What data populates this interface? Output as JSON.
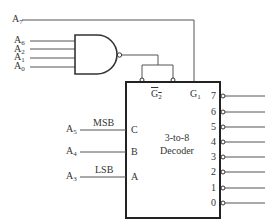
{
  "diagram": {
    "type": "logic-circuit"
  },
  "inputs": {
    "a7": {
      "base": "A",
      "sub": "7"
    },
    "a6": {
      "base": "A",
      "sub": "6"
    },
    "a2": {
      "base": "A",
      "sub": "2"
    },
    "a1": {
      "base": "A",
      "sub": "1"
    },
    "a0": {
      "base": "A",
      "sub": "0"
    },
    "a5": {
      "base": "A",
      "sub": "5"
    },
    "a4": {
      "base": "A",
      "sub": "4"
    },
    "a3": {
      "base": "A",
      "sub": "3"
    }
  },
  "annotations": {
    "msb": "MSB",
    "lsb": "LSB"
  },
  "gate": {
    "type": "NAND",
    "inputs": [
      "A6",
      "A2",
      "A1",
      "A0"
    ]
  },
  "decoder": {
    "title_line1": "3-to-8",
    "title_line2": "Decoder",
    "enable_g2": {
      "base": "G",
      "sub": "2"
    },
    "enable_g1": {
      "base": "G",
      "sub": "1"
    },
    "select_pins": {
      "c": "C",
      "b": "B",
      "a": "A"
    },
    "outputs": [
      "7",
      "6",
      "5",
      "4",
      "3",
      "2",
      "1",
      "0"
    ]
  },
  "colors": {
    "line": "#555555",
    "box": "#222222",
    "text": "#333333",
    "background": "#ffffff"
  }
}
